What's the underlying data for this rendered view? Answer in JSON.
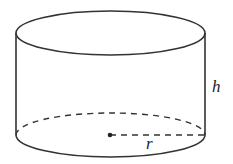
{
  "diagram": {
    "type": "cylinder",
    "labels": {
      "height": "h",
      "radius": "r"
    },
    "colors": {
      "stroke": "#333333",
      "background": "#ffffff"
    }
  }
}
